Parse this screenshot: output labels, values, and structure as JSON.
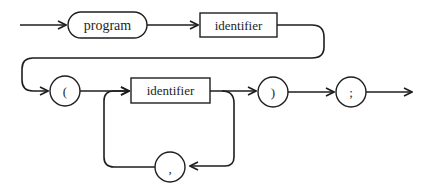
{
  "diagram": {
    "type": "syntax-diagram",
    "nodes": {
      "program": {
        "label": "program",
        "shape": "rounded"
      },
      "identifier_1": {
        "label": "identifier",
        "shape": "rectangle"
      },
      "lparen": {
        "label": "(",
        "shape": "circle"
      },
      "identifier_2": {
        "label": "identifier",
        "shape": "rectangle"
      },
      "rparen": {
        "label": ")",
        "shape": "circle"
      },
      "semicolon": {
        "label": ";",
        "shape": "circle"
      },
      "comma": {
        "label": ",",
        "shape": "circle"
      }
    },
    "edges": [
      [
        "start",
        "program"
      ],
      [
        "program",
        "identifier_1"
      ],
      [
        "identifier_1",
        "lparen"
      ],
      [
        "lparen",
        "identifier_2"
      ],
      [
        "identifier_2",
        "rparen"
      ],
      [
        "identifier_2",
        "comma"
      ],
      [
        "comma",
        "identifier_2"
      ],
      [
        "rparen",
        "semicolon"
      ],
      [
        "semicolon",
        "end"
      ]
    ],
    "colors": {
      "stroke": "#1e1e1e",
      "background": "#ffffff"
    }
  }
}
